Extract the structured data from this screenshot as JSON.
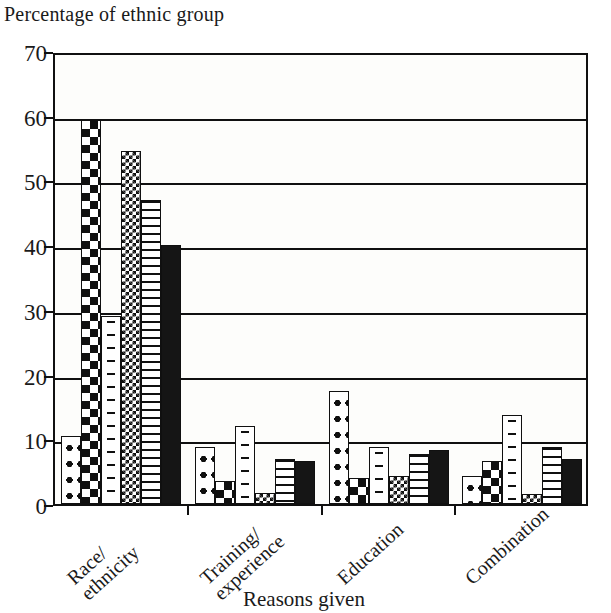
{
  "chart_data": {
    "type": "bar",
    "title": "Percentage of ethnic group",
    "xlabel": "Reasons given",
    "ylabel": "Percentage of ethnic group",
    "categories": [
      "Race/ethnicity",
      "Training/experience",
      "Education",
      "Combination"
    ],
    "category_lines": [
      [
        "Race/",
        "ethnicity"
      ],
      [
        "Training/",
        "experience"
      ],
      [
        "Education",
        ""
      ],
      [
        "Combination",
        ""
      ]
    ],
    "ylim": [
      0,
      70
    ],
    "yticks": [
      0,
      10,
      20,
      30,
      40,
      50,
      60,
      70
    ],
    "ytick_labels": [
      "0",
      "10",
      "20",
      "30",
      "40",
      "50",
      "60",
      "70"
    ],
    "grid": true,
    "legend": "none",
    "series": [
      {
        "name": "series-1",
        "pattern": "large-dots",
        "values": [
          10.5,
          8.8,
          17.5,
          4.3
        ]
      },
      {
        "name": "series-2",
        "pattern": "large-checkerboard",
        "values": [
          59.3,
          3.5,
          4.0,
          6.7
        ]
      },
      {
        "name": "series-3",
        "pattern": "dashes",
        "values": [
          29.0,
          12.1,
          8.8,
          13.7
        ]
      },
      {
        "name": "series-4",
        "pattern": "fine-checkerboard",
        "values": [
          54.6,
          1.7,
          4.3,
          1.6
        ]
      },
      {
        "name": "series-5",
        "pattern": "horizontal-lines",
        "values": [
          47.0,
          7.0,
          7.8,
          8.8
        ]
      },
      {
        "name": "series-6",
        "pattern": "solid-black",
        "values": [
          40.0,
          6.6,
          8.4,
          7.0
        ]
      }
    ]
  },
  "colors": {
    "ink": "#101010",
    "plot_background": "#fdfdfb",
    "page_background": "#ffffff"
  }
}
